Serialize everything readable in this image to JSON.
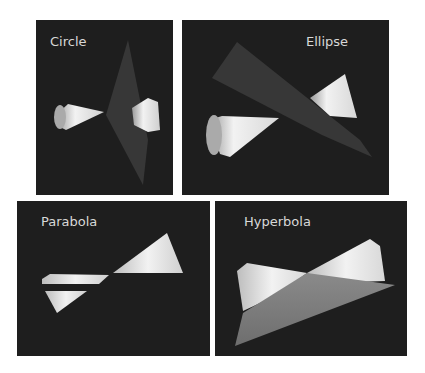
{
  "figure": {
    "panels": [
      {
        "id": "circle",
        "label": "Circle"
      },
      {
        "id": "ellipse",
        "label": "Ellipse"
      },
      {
        "id": "parabola",
        "label": "Parabola"
      },
      {
        "id": "hyperbola",
        "label": "Hyperbola"
      }
    ]
  },
  "colors": {
    "panel_background": "#1e1e1e",
    "label_text": "#d8d8d8",
    "cone_light": "#f2f2f2",
    "cone_shadow": "#9a9a9a",
    "plane": "#3a3a3a"
  }
}
